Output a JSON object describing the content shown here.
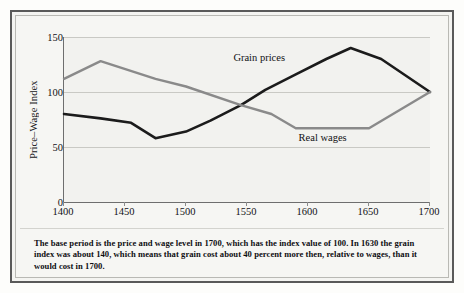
{
  "caption": "The base period is the price and wage level in 1700, which has the index value of 100. In 1630 the grain index was about 140, which means that grain cost about 40 percent more then, relative to wages, than it would cost in 1700.",
  "chart_data": {
    "type": "line",
    "title": "",
    "xlabel": "",
    "ylabel": "Price–Wage Index",
    "xlim": [
      1400,
      1700
    ],
    "ylim": [
      0,
      150
    ],
    "x_ticks": [
      1400,
      1450,
      1500,
      1550,
      1600,
      1650,
      1700
    ],
    "x_tick_labels": [
      "1400",
      "1450",
      "1500",
      "1550",
      "1600",
      "1650",
      "1700"
    ],
    "y_ticks": [
      0,
      50,
      100,
      150
    ],
    "y_tick_labels": [
      "0",
      "50",
      "100",
      "150"
    ],
    "grid": "horizontal",
    "legend": "inline-annotations",
    "series": [
      {
        "name": "Grain prices",
        "color": "#1b1b1b",
        "width": 2.6,
        "label_position": "above-line",
        "x": [
          1400,
          1430,
          1455,
          1475,
          1500,
          1520,
          1545,
          1565,
          1590,
          1615,
          1635,
          1660,
          1700
        ],
        "values": [
          80,
          76,
          72,
          58,
          64,
          74,
          88,
          102,
          116,
          130,
          140,
          130,
          100
        ]
      },
      {
        "name": "Real wages",
        "color": "#8a8a8a",
        "width": 2.4,
        "label_position": "below-line",
        "x": [
          1400,
          1430,
          1475,
          1500,
          1545,
          1570,
          1590,
          1650,
          1700
        ],
        "values": [
          112,
          128,
          112,
          105,
          88,
          80,
          67,
          67,
          100
        ]
      }
    ],
    "annotations": [
      {
        "text": "Grain prices",
        "x": 1560,
        "y": 131
      },
      {
        "text": "Real wages",
        "x": 1612,
        "y": 58
      }
    ]
  }
}
